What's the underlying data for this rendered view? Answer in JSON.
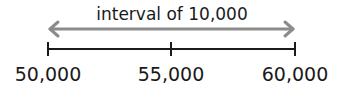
{
  "diagram": {
    "interval_label": "interval of 10,000",
    "arrow_color": "#8c8c8c",
    "line_color": "#1a1a1a",
    "ticks": [
      {
        "label": "50,000",
        "x": 48
      },
      {
        "label": "55,000",
        "x": 171
      },
      {
        "label": "60,000",
        "x": 295
      }
    ]
  }
}
